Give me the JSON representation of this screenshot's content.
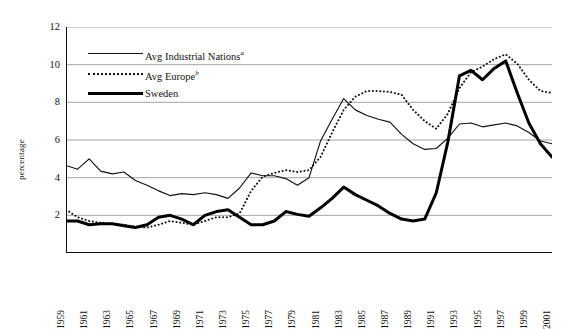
{
  "chart_data": {
    "type": "line",
    "title": "",
    "xlabel": "",
    "ylabel": "percentage",
    "ylim": [
      0,
      12
    ],
    "ytick_values": [
      0,
      2,
      4,
      6,
      8,
      10,
      12
    ],
    "ytick_labels": [
      "",
      "2",
      "4",
      "6",
      "8",
      "10",
      "12"
    ],
    "grid": "horizontal",
    "legend_position": "upper-left-inside",
    "x": [
      1959,
      1960,
      1961,
      1962,
      1963,
      1964,
      1965,
      1966,
      1967,
      1968,
      1969,
      1970,
      1971,
      1972,
      1973,
      1974,
      1975,
      1976,
      1977,
      1978,
      1979,
      1980,
      1981,
      1982,
      1983,
      1984,
      1985,
      1986,
      1987,
      1988,
      1989,
      1990,
      1991,
      1992,
      1993,
      1994,
      1995,
      1996,
      1997,
      1998,
      1999,
      2000,
      2001
    ],
    "xtick_labels": [
      "1959",
      "1961",
      "1963",
      "1965",
      "1967",
      "1969",
      "1971",
      "1973",
      "1975",
      "1977",
      "1979",
      "1981",
      "1983",
      "1985",
      "1987",
      "1989",
      "1991",
      "1993",
      "1995",
      "1997",
      "1999",
      "2001"
    ],
    "xlim": [
      1959,
      2001
    ],
    "series": [
      {
        "name": "Avg Industrial Nations",
        "footnote": "a",
        "style": "solid-thin",
        "color": "#111111",
        "values": [
          4.65,
          4.45,
          5.0,
          4.35,
          4.2,
          4.3,
          3.85,
          3.6,
          3.3,
          3.05,
          3.15,
          3.1,
          3.2,
          3.1,
          2.9,
          3.45,
          4.25,
          4.1,
          4.1,
          3.95,
          3.6,
          4.0,
          5.95,
          7.1,
          8.2,
          7.6,
          7.3,
          7.1,
          6.95,
          6.3,
          5.8,
          5.5,
          5.55,
          6.1,
          6.85,
          6.9,
          6.7,
          6.8,
          6.9,
          6.75,
          6.4,
          5.95,
          5.8
        ]
      },
      {
        "name": "Avg Europe",
        "footnote": "b",
        "style": "dotted",
        "color": "#111111",
        "values": [
          2.3,
          1.9,
          1.7,
          1.6,
          1.55,
          1.5,
          1.4,
          1.35,
          1.5,
          1.7,
          1.6,
          1.5,
          1.7,
          1.9,
          1.9,
          2.1,
          3.3,
          4.05,
          4.25,
          4.4,
          4.3,
          4.4,
          5.1,
          6.4,
          7.6,
          8.3,
          8.6,
          8.6,
          8.55,
          8.4,
          7.6,
          7.0,
          6.6,
          7.4,
          8.75,
          9.6,
          9.9,
          10.3,
          10.55,
          10.05,
          9.2,
          8.6,
          8.5
        ]
      },
      {
        "name": "Sweden",
        "footnote": "",
        "style": "solid-thick",
        "color": "#000000",
        "values": [
          1.7,
          1.7,
          1.5,
          1.55,
          1.55,
          1.45,
          1.35,
          1.5,
          1.9,
          2.0,
          1.8,
          1.5,
          2.0,
          2.2,
          2.3,
          1.9,
          1.5,
          1.5,
          1.7,
          2.2,
          2.05,
          1.95,
          2.4,
          2.9,
          3.5,
          3.1,
          2.8,
          2.5,
          2.1,
          1.8,
          1.7,
          1.8,
          3.2,
          5.9,
          9.4,
          9.7,
          9.2,
          9.8,
          10.2,
          8.5,
          6.9,
          5.8,
          5.1
        ]
      }
    ]
  },
  "axis": {
    "y_title": "percentage"
  }
}
